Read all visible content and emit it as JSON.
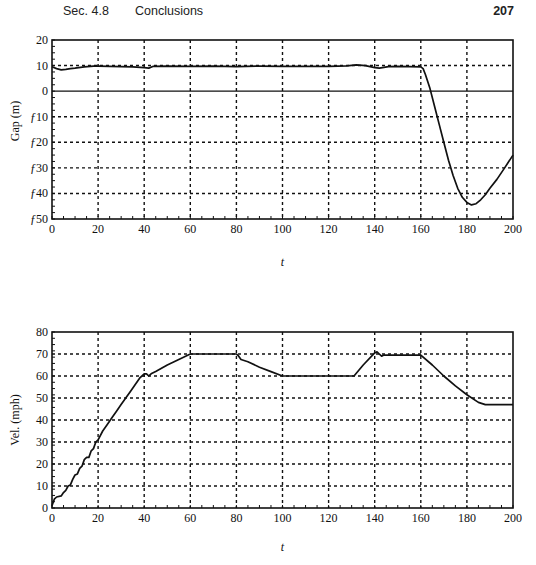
{
  "header": {
    "section": "Sec. 4.8",
    "title": "Conclusions",
    "page_number": "207"
  },
  "chart_data": [
    {
      "type": "line",
      "title": "",
      "xlabel": "t",
      "ylabel": "Gap (m)",
      "xlim": [
        0,
        200
      ],
      "ylim": [
        -50,
        20
      ],
      "xticks": [
        0,
        20,
        40,
        60,
        80,
        100,
        120,
        140,
        160,
        180,
        200
      ],
      "xtick_labels": [
        "0",
        "20",
        "40",
        "60",
        "80",
        "100",
        "120",
        "140",
        "160",
        "180",
        "200"
      ],
      "yticks": [
        20,
        10,
        0,
        -10,
        -20,
        -30,
        -40,
        -50
      ],
      "ytick_labels": [
        "20",
        "10",
        "0",
        "ƒ10",
        "ƒ20",
        "ƒ30",
        "ƒ40",
        "ƒ50"
      ],
      "grid": "dashed",
      "reference_lines": [
        {
          "y": 0,
          "style": "solid"
        }
      ],
      "series": [
        {
          "name": "gap",
          "x": [
            0,
            2,
            4,
            6,
            8,
            10,
            14,
            18,
            20,
            25,
            30,
            35,
            40,
            42,
            44,
            50,
            60,
            70,
            80,
            90,
            100,
            110,
            120,
            128,
            132,
            136,
            140,
            142,
            146,
            150,
            155,
            160,
            161,
            162,
            164,
            166,
            168,
            170,
            172,
            174,
            176,
            178,
            180,
            182,
            184,
            186,
            188,
            190,
            193,
            196,
            200
          ],
          "y": [
            9.5,
            8.8,
            8.3,
            8.5,
            8.8,
            9.0,
            9.5,
            9.8,
            9.8,
            9.7,
            9.6,
            9.5,
            9.2,
            9.0,
            9.7,
            9.8,
            9.7,
            9.8,
            9.6,
            9.8,
            9.7,
            9.7,
            9.7,
            9.9,
            10.3,
            10.0,
            9.2,
            9.0,
            9.6,
            9.7,
            9.6,
            9.5,
            8.8,
            6.5,
            1.0,
            -6.0,
            -13.0,
            -20.0,
            -27.0,
            -33.0,
            -38.0,
            -41.5,
            -43.5,
            -44.5,
            -44.0,
            -42.5,
            -40.5,
            -38.0,
            -34.5,
            -30.5,
            -25.0
          ]
        }
      ]
    },
    {
      "type": "line",
      "title": "",
      "xlabel": "t",
      "ylabel": "Vel. (mph)",
      "xlim": [
        0,
        200
      ],
      "ylim": [
        0,
        80
      ],
      "xticks": [
        0,
        20,
        40,
        60,
        80,
        100,
        120,
        140,
        160,
        180,
        200
      ],
      "xtick_labels": [
        "0",
        "20",
        "40",
        "60",
        "80",
        "100",
        "120",
        "140",
        "160",
        "180",
        "200"
      ],
      "yticks": [
        80,
        70,
        60,
        50,
        40,
        30,
        20,
        10,
        0
      ],
      "ytick_labels": [
        "80",
        "70",
        "60",
        "50",
        "40",
        "30",
        "20",
        "10",
        "0"
      ],
      "grid": "dashed",
      "series": [
        {
          "name": "velocity",
          "x": [
            0,
            1,
            2,
            4,
            5,
            6,
            7,
            8,
            9,
            10,
            11,
            12,
            13,
            14,
            15,
            16,
            17,
            18,
            19,
            20,
            22,
            24,
            26,
            28,
            30,
            34,
            38,
            40,
            41,
            42,
            43,
            45,
            50,
            55,
            60,
            65,
            70,
            75,
            80,
            81,
            82,
            85,
            90,
            95,
            100,
            110,
            120,
            131,
            135,
            140,
            141,
            142,
            143,
            144,
            146,
            150,
            155,
            160,
            165,
            170,
            175,
            180,
            185,
            188,
            192,
            196,
            200
          ],
          "y": [
            1,
            4,
            5,
            5.5,
            7,
            8,
            10,
            10.5,
            13,
            15,
            15.5,
            18,
            19,
            22,
            23,
            23,
            26,
            27,
            30,
            31,
            35,
            38,
            41,
            44,
            47,
            53,
            59,
            61,
            61,
            60,
            61,
            62,
            65,
            67.5,
            70,
            70,
            70,
            70,
            70,
            69,
            67.5,
            66.5,
            64,
            62,
            60,
            60,
            60,
            60,
            65,
            70.5,
            71,
            70,
            69,
            69.5,
            69.5,
            69.5,
            69.5,
            69.5,
            65,
            60,
            55.5,
            51.5,
            48,
            47,
            47,
            47,
            47
          ]
        }
      ]
    }
  ],
  "caption_partial": "Figure (truncated)"
}
